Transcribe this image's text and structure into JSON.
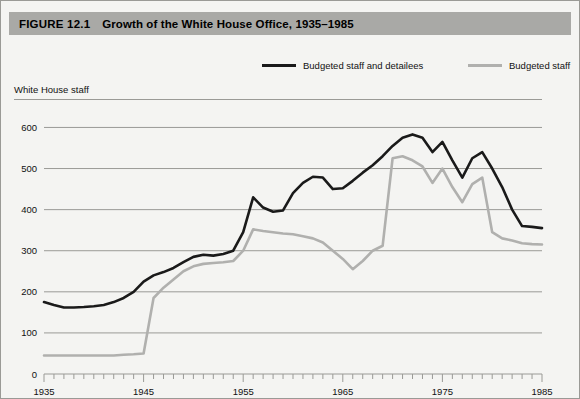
{
  "figure": {
    "number_label": "FIGURE 12.1",
    "title": "Growth of the White House Office, 1935–1985",
    "banner_color": "#a9a9a6",
    "background_color": "#f4f4f2"
  },
  "legend": {
    "position": "top-center",
    "entries": [
      {
        "label": "Budgeted staff and detailees",
        "color": "#1a1a1a",
        "x": 262
      },
      {
        "label": "Budgeted staff",
        "color": "#b0b0ae",
        "x": 468
      }
    ]
  },
  "axis_caption": "White House staff",
  "chart_data": {
    "type": "line",
    "title": "Growth of the White House Office, 1935–1985",
    "subtitle": "",
    "xlabel": "",
    "ylabel": "White House staff",
    "xlim": [
      1935,
      1985
    ],
    "ylim": [
      0,
      640
    ],
    "yticks": [
      0,
      100,
      200,
      300,
      400,
      500,
      600
    ],
    "ytick_labels": [
      "0",
      "100",
      "200",
      "300",
      "400",
      "500",
      "600"
    ],
    "xticks": [
      1935,
      1945,
      1955,
      1965,
      1975,
      1985
    ],
    "xtick_labels": [
      "1935",
      "1945",
      "1955",
      "1965",
      "1975",
      "1985"
    ],
    "minor_xtick_interval": 1,
    "grid": "horizontal",
    "legend_position": "above-plot",
    "x": [
      1935,
      1936,
      1937,
      1938,
      1939,
      1940,
      1941,
      1942,
      1943,
      1944,
      1945,
      1946,
      1947,
      1948,
      1949,
      1950,
      1951,
      1952,
      1953,
      1954,
      1955,
      1956,
      1957,
      1958,
      1959,
      1960,
      1961,
      1962,
      1963,
      1964,
      1965,
      1966,
      1967,
      1968,
      1969,
      1970,
      1971,
      1972,
      1973,
      1974,
      1975,
      1976,
      1977,
      1978,
      1979,
      1980,
      1981,
      1982,
      1983,
      1984,
      1985
    ],
    "series": [
      {
        "name": "Budgeted staff and detailees",
        "color": "#1a1a1a",
        "width": 2.6,
        "values": [
          175,
          168,
          162,
          162,
          163,
          165,
          168,
          175,
          185,
          200,
          225,
          240,
          248,
          258,
          272,
          285,
          290,
          288,
          292,
          300,
          345,
          430,
          405,
          395,
          398,
          440,
          465,
          480,
          478,
          450,
          452,
          470,
          490,
          508,
          530,
          555,
          575,
          583,
          575,
          540,
          565,
          520,
          478,
          525,
          540,
          500,
          455,
          400,
          360,
          358,
          355
        ]
      },
      {
        "name": "Budgeted staff",
        "color": "#b0b0ae",
        "width": 2.6,
        "values": [
          45,
          45,
          45,
          45,
          45,
          45,
          45,
          45,
          47,
          48,
          50,
          185,
          210,
          230,
          250,
          262,
          268,
          270,
          272,
          275,
          300,
          352,
          348,
          345,
          342,
          340,
          335,
          330,
          320,
          300,
          280,
          255,
          275,
          300,
          312,
          525,
          530,
          520,
          505,
          465,
          500,
          455,
          418,
          462,
          478,
          345,
          330,
          325,
          318,
          316,
          315
        ]
      }
    ]
  },
  "plot_geometry": {
    "left": 44,
    "right": 542,
    "top": 111,
    "bottom": 374,
    "axis_color": "#9a9a96",
    "grid_color": "#9a9a96"
  }
}
